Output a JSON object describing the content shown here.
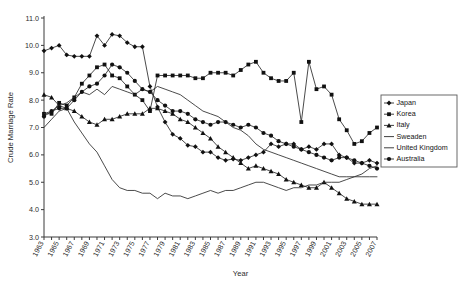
{
  "chart_data": {
    "type": "line",
    "title": "",
    "xlabel": "Year",
    "ylabel": "Crude Marriage Rate",
    "xlim": [
      1963,
      2007
    ],
    "ylim": [
      3.0,
      11.0
    ],
    "yticks": [
      "3.0",
      "4.0",
      "5.0",
      "6.0",
      "7.0",
      "8.0",
      "9.0",
      "10.0",
      "11.0"
    ],
    "grid": false,
    "legend_position": "right",
    "x": [
      1963,
      1964,
      1965,
      1966,
      1967,
      1968,
      1969,
      1970,
      1971,
      1972,
      1973,
      1974,
      1975,
      1976,
      1977,
      1978,
      1979,
      1980,
      1981,
      1982,
      1983,
      1984,
      1985,
      1986,
      1987,
      1988,
      1989,
      1990,
      1991,
      1992,
      1993,
      1994,
      1995,
      1996,
      1997,
      1998,
      1999,
      2000,
      2001,
      2002,
      2003,
      2004,
      2005,
      2006,
      2007
    ],
    "xtick_labels": [
      "1963",
      "1965",
      "1967",
      "1969",
      "1971",
      "1973",
      "1975",
      "1977",
      "1979",
      "1981",
      "1983",
      "1985",
      "1987",
      "1989",
      "1991",
      "1993",
      "1995",
      "1997",
      "1999",
      "2001",
      "2003",
      "2005",
      "2007"
    ],
    "series": [
      {
        "name": "Japan",
        "marker": "diamond",
        "values": [
          9.8,
          9.9,
          10.0,
          9.65,
          9.6,
          9.6,
          9.6,
          10.35,
          10.0,
          10.4,
          10.35,
          10.1,
          9.95,
          9.95,
          8.5,
          7.75,
          7.2,
          6.75,
          6.6,
          6.35,
          6.3,
          6.1,
          6.1,
          5.9,
          5.8,
          5.85,
          5.8,
          5.9,
          6.0,
          6.1,
          6.4,
          6.3,
          6.4,
          6.4,
          6.2,
          6.3,
          6.2,
          6.4,
          6.4,
          6.0,
          5.9,
          5.7,
          5.7,
          5.8,
          5.7
        ]
      },
      {
        "name": "Korea",
        "marker": "square",
        "values": [
          7.5,
          7.5,
          7.9,
          7.8,
          8.1,
          8.6,
          8.9,
          9.2,
          9.3,
          8.9,
          8.8,
          8.5,
          8.2,
          8.0,
          7.6,
          8.9,
          8.9,
          8.9,
          8.9,
          8.9,
          8.8,
          8.8,
          9.0,
          9.0,
          9.0,
          8.9,
          9.1,
          9.3,
          9.4,
          9.0,
          8.8,
          8.7,
          8.7,
          9.0,
          7.2,
          9.4,
          8.4,
          8.5,
          8.2,
          7.3,
          6.9,
          6.4,
          6.5,
          6.8,
          7.0
        ]
      },
      {
        "name": "Italy",
        "marker": "triangle",
        "values": [
          8.2,
          8.1,
          7.8,
          7.7,
          7.6,
          7.4,
          7.2,
          7.1,
          7.3,
          7.3,
          7.4,
          7.5,
          7.5,
          7.5,
          7.7,
          7.7,
          7.6,
          7.5,
          7.3,
          7.2,
          7.0,
          6.8,
          6.6,
          6.3,
          6.1,
          5.9,
          5.7,
          5.5,
          5.6,
          5.5,
          5.4,
          5.3,
          5.1,
          5.0,
          4.9,
          4.8,
          4.8,
          5.0,
          4.8,
          4.6,
          4.4,
          4.3,
          4.2,
          4.2,
          4.2
        ]
      },
      {
        "name": "Sweaden",
        "marker": "none",
        "values": [
          7.0,
          7.3,
          7.6,
          7.7,
          7.2,
          6.8,
          6.4,
          6.1,
          5.6,
          5.1,
          4.8,
          4.7,
          4.7,
          4.6,
          4.6,
          4.4,
          4.6,
          4.5,
          4.5,
          4.4,
          4.5,
          4.6,
          4.7,
          4.6,
          4.7,
          4.7,
          4.8,
          4.9,
          5.0,
          5.0,
          4.9,
          4.8,
          4.7,
          4.8,
          4.8,
          4.9,
          4.9,
          5.0,
          5.0,
          5.0,
          5.1,
          5.2,
          5.3,
          5.5,
          5.6
        ]
      },
      {
        "name": "United Kingdom",
        "marker": "none",
        "values": [
          7.5,
          7.6,
          7.8,
          7.9,
          8.1,
          8.3,
          8.2,
          8.4,
          8.2,
          8.5,
          8.4,
          8.3,
          8.2,
          8.4,
          8.3,
          8.5,
          8.4,
          8.3,
          8.2,
          8.0,
          7.8,
          7.6,
          7.5,
          7.4,
          7.2,
          7.0,
          6.9,
          6.7,
          6.4,
          6.2,
          6.1,
          6.0,
          5.9,
          5.8,
          5.7,
          5.6,
          5.5,
          5.4,
          5.3,
          5.2,
          5.2,
          5.2,
          5.2,
          5.2,
          5.2
        ]
      },
      {
        "name": "Australia",
        "marker": "circle",
        "values": [
          7.4,
          7.6,
          7.7,
          7.7,
          8.0,
          8.3,
          8.5,
          8.6,
          8.9,
          9.3,
          9.2,
          9.0,
          8.7,
          8.4,
          8.3,
          8.0,
          7.8,
          7.6,
          7.6,
          7.5,
          7.3,
          7.2,
          7.1,
          7.2,
          7.2,
          7.1,
          7.0,
          7.1,
          7.0,
          6.8,
          6.7,
          6.5,
          6.4,
          6.3,
          6.2,
          6.1,
          6.0,
          5.9,
          5.8,
          5.9,
          5.9,
          5.8,
          5.7,
          5.6,
          5.5
        ]
      }
    ]
  }
}
